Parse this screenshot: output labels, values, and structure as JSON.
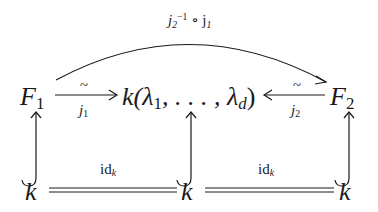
{
  "diagram": {
    "nodes": {
      "F1": {
        "base": "F",
        "sub": "1"
      },
      "center": {
        "text": "k(λ",
        "sub1": "1",
        "mid": ", . . . , λ",
        "sub2": "d",
        "end": ")"
      },
      "F2": {
        "base": "F",
        "sub": "2"
      },
      "k_left": "k",
      "k_mid": "k",
      "k_right": "k"
    },
    "arrows": {
      "curved_top": {
        "label_base": "j",
        "label_sub": "2",
        "label_sup": "−1",
        "label_rest": " ∘ j",
        "label_rest_sub": "1"
      },
      "j1": {
        "above": "~",
        "below_base": "j",
        "below_sub": "1"
      },
      "j2": {
        "above": "~",
        "below_base": "j",
        "below_sub": "2"
      },
      "id_left": {
        "base": "id",
        "sub": "k"
      },
      "id_right": {
        "base": "id",
        "sub": "k"
      }
    },
    "line_color": "#1a1a1a"
  }
}
